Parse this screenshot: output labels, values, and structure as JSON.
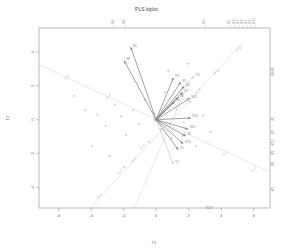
{
  "chart_data": {
    "type": "scatter",
    "title": "PLS biplot",
    "xlabel": "T1",
    "ylabel": "T2",
    "xlim": [
      -7.2,
      7.0
    ],
    "ylim": [
      -5.2,
      5.4
    ],
    "xticks": [
      -6,
      -4,
      -2,
      0,
      2,
      4,
      6
    ],
    "xticklabels": [
      "-6",
      "-4",
      "-2",
      "0",
      "2",
      "4",
      "6"
    ],
    "yticks": [
      -4,
      -2,
      0,
      2,
      4
    ],
    "yticklabels": [
      "-4",
      "-2",
      "0",
      "2",
      "4"
    ],
    "grid": false,
    "legend": null,
    "top_axis_labels": [
      {
        "text": "X4",
        "x": -2.6
      },
      {
        "text": "X6",
        "x": -1.9
      },
      {
        "text": "X9",
        "x": 3.0
      },
      {
        "text": "X5",
        "x": 4.55
      },
      {
        "text": "X3",
        "x": 4.85
      },
      {
        "text": "X7",
        "x": 5.1
      },
      {
        "text": "X8",
        "x": 5.35
      },
      {
        "text": "X1",
        "x": 5.6
      },
      {
        "text": "X2",
        "x": 5.85
      },
      {
        "text": "X11",
        "x": 6.1
      }
    ],
    "right_axis_labels": [
      {
        "text": "X6",
        "y": 2.95
      },
      {
        "text": "X4",
        "y": 2.7
      },
      {
        "text": "X1",
        "y": 0.05
      },
      {
        "text": "X7",
        "y": -0.72
      },
      {
        "text": "X12",
        "y": -1.35
      },
      {
        "text": "X2",
        "y": -1.95
      },
      {
        "text": "X3",
        "y": -2.6
      },
      {
        "text": "X2",
        "y": -4.1
      }
    ],
    "bottom_axis_labels": [
      {
        "text": "X13",
        "x": 3.25
      }
    ],
    "origin": [
      0,
      0
    ],
    "vectors": [
      {
        "label": "X4",
        "x": -1.55,
        "y": 4.25,
        "style": "dark"
      },
      {
        "label": "X6",
        "x": -1.95,
        "y": 3.45,
        "style": "dark"
      },
      {
        "label": "X9",
        "x": 1.05,
        "y": 2.45,
        "style": "dark"
      },
      {
        "label": "X5",
        "x": 1.5,
        "y": 2.2,
        "style": "dark"
      },
      {
        "label": "X3",
        "x": 1.7,
        "y": 1.95,
        "style": "dark"
      },
      {
        "label": "X7",
        "x": 1.62,
        "y": 1.6,
        "style": "dark"
      },
      {
        "label": "X8",
        "x": 1.35,
        "y": 1.3,
        "style": "dark"
      },
      {
        "label": "X1",
        "x": 1.12,
        "y": 1.05,
        "style": "dark"
      },
      {
        "label": "X11",
        "x": 2.05,
        "y": 1.25,
        "style": "dark"
      },
      {
        "label": "X10",
        "x": 2.1,
        "y": 0.1,
        "style": "dark"
      },
      {
        "label": "X12",
        "x": 1.95,
        "y": -0.55,
        "style": "dark"
      },
      {
        "label": "X2",
        "x": 1.8,
        "y": -0.95,
        "style": "dark"
      },
      {
        "label": "X13",
        "x": 1.65,
        "y": -1.4,
        "style": "dark"
      },
      {
        "label": "Y1",
        "x": 1.35,
        "y": -1.75,
        "style": "dark"
      },
      {
        "label": "Y2",
        "x": 1.05,
        "y": -2.6,
        "style": "light"
      },
      {
        "label": "Y3",
        "x": 2.3,
        "y": 2.55,
        "style": "light"
      }
    ],
    "calibration_axes": [
      {
        "name": "axis-a",
        "x1": -7.2,
        "y1": 3.25,
        "x2": 6.9,
        "y2": -3.05
      },
      {
        "name": "axis-b",
        "x1": -4.05,
        "y1": -5.2,
        "x2": 5.35,
        "y2": 4.55
      },
      {
        "name": "axis-c",
        "x1": -1.35,
        "y1": -5.2,
        "x2": 2.0,
        "y2": 2.2
      }
    ],
    "calibration_marks": [
      {
        "text": "6",
        "x": -5.55,
        "y": 2.45
      },
      {
        "text": "5",
        "x": -3.0,
        "y": 1.3
      },
      {
        "text": "4",
        "x": -0.1,
        "y": -0.05
      },
      {
        "text": "3",
        "x": 1.6,
        "y": -0.95
      },
      {
        "text": "2",
        "x": 4.15,
        "y": -2.05
      },
      {
        "text": "1",
        "x": 5.95,
        "y": -3.0
      },
      {
        "text": "0",
        "x": -3.55,
        "y": -4.55
      },
      {
        "text": "2",
        "x": -2.3,
        "y": -3.15
      },
      {
        "text": "4",
        "x": -0.9,
        "y": -1.7
      },
      {
        "text": "8",
        "x": 2.5,
        "y": 1.6
      },
      {
        "text": "10",
        "x": 3.6,
        "y": 2.75
      },
      {
        "text": "12",
        "x": 4.95,
        "y": 4.1
      },
      {
        "text": "6",
        "x": -1.45,
        "y": -2.45
      }
    ],
    "points": [
      {
        "label": "",
        "x": -5.05,
        "y": 1.4
      },
      {
        "label": "",
        "x": -4.35,
        "y": 0.55
      },
      {
        "label": "",
        "x": -3.6,
        "y": 0.3
      },
      {
        "label": "",
        "x": -3.1,
        "y": -0.35
      },
      {
        "label": "",
        "x": -2.55,
        "y": 0.9
      },
      {
        "label": "",
        "x": -2.15,
        "y": 0.2
      },
      {
        "label": "",
        "x": -1.85,
        "y": -0.9
      },
      {
        "label": "",
        "x": -1.4,
        "y": 0.55
      },
      {
        "label": "",
        "x": -1.05,
        "y": -0.25
      },
      {
        "label": "",
        "x": -0.7,
        "y": 1.15
      },
      {
        "label": "",
        "x": -0.45,
        "y": -1.3
      },
      {
        "label": "",
        "x": -0.1,
        "y": 0.35
      },
      {
        "label": "",
        "x": 0.3,
        "y": -0.55
      },
      {
        "label": "",
        "x": 0.55,
        "y": 1.6
      },
      {
        "label": "",
        "x": 0.95,
        "y": -1.05
      },
      {
        "label": "",
        "x": 1.25,
        "y": 0.6
      },
      {
        "label": "",
        "x": 1.7,
        "y": -0.15
      },
      {
        "label": "",
        "x": 2.1,
        "y": 1.05
      },
      {
        "label": "",
        "x": 2.45,
        "y": -1.55
      },
      {
        "label": "",
        "x": 2.9,
        "y": 0.25
      },
      {
        "label": "",
        "x": 3.35,
        "y": -0.7
      },
      {
        "label": "",
        "x": -3.95,
        "y": -1.55
      },
      {
        "label": "",
        "x": -2.85,
        "y": -2.15
      },
      {
        "label": "",
        "x": -1.95,
        "y": -2.8
      },
      {
        "label": "",
        "x": 0.75,
        "y": 2.85
      },
      {
        "label": "",
        "x": 1.95,
        "y": 3.3
      }
    ]
  }
}
